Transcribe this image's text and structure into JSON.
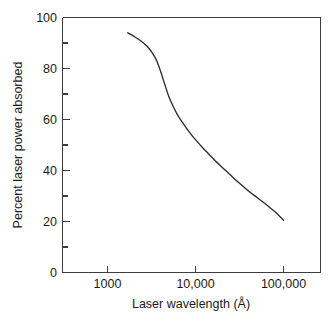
{
  "chart_data": {
    "type": "line",
    "title": "",
    "xlabel": "Laser wavelength (Å)",
    "ylabel": "Percent laser power absorbed",
    "xscale": "log",
    "yscale": "linear",
    "xlim": [
      400,
      160000
    ],
    "ylim": [
      0,
      100
    ],
    "grid": false,
    "legend": null,
    "x_tick_labels": [
      "1000",
      "10,000",
      "100,000"
    ],
    "x_tick_values": [
      1000,
      10000,
      100000
    ],
    "y_tick_labels": [
      "0",
      "20",
      "40",
      "60",
      "80",
      "100"
    ],
    "y_tick_values": [
      0,
      20,
      40,
      60,
      80,
      100
    ],
    "y_minor_tick_values": [
      10,
      30,
      50,
      70,
      90
    ],
    "series": [
      {
        "name": "Percent laser power absorbed",
        "color": "#2b2b2b",
        "x": [
          1700,
          2000,
          2400,
          2800,
          3200,
          3600,
          4000,
          4500,
          5000,
          5600,
          6300,
          7000,
          8000,
          9000,
          10000,
          12000,
          14000,
          17000,
          20000,
          25000,
          30000,
          40000,
          50000,
          65000,
          80000,
          100000
        ],
        "y": [
          94.0,
          92.6,
          90.8,
          88.8,
          86.3,
          83.2,
          79.0,
          73.5,
          68.8,
          65.0,
          61.6,
          59.2,
          56.3,
          54.0,
          52.1,
          49.0,
          46.6,
          43.6,
          41.3,
          38.2,
          35.7,
          32.0,
          29.4,
          26.4,
          23.8,
          20.5
        ]
      }
    ]
  },
  "axes": {
    "y_axis_title": "Percent laser power absorbed",
    "x_axis_title": "Laser wavelength (Å)"
  },
  "colors": {
    "curve": "#2b2b2b",
    "axis": "#3d3d3d",
    "background": "#ffffff",
    "text": "#1a1a1a"
  }
}
